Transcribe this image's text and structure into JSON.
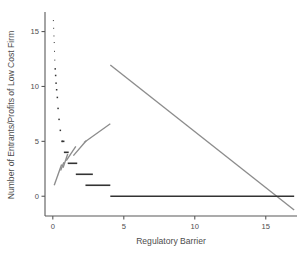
{
  "chart_data": {
    "type": "line",
    "title": "",
    "subtitle": "",
    "xlabel": "Regulatory Barrier",
    "ylabel": "Number of Entrants/Profits of Low Cost Firm",
    "xlim": [
      -0.55,
      17.2
    ],
    "ylim": [
      -1.8,
      16.6
    ],
    "xticks": [
      0,
      5,
      10,
      15
    ],
    "xtick_labels": [
      "0",
      "5",
      "10",
      "15"
    ],
    "yticks": [
      0,
      5,
      10,
      15
    ],
    "ytick_labels": [
      "0",
      "5",
      "10",
      "15"
    ],
    "grid": false,
    "legend": "none",
    "colors": {
      "entrants": "#333333",
      "profits": "#8c8c8c",
      "axis": "#595959",
      "text": "#4d4d4d",
      "background": "#ffffff"
    },
    "series": [
      {
        "name": "Number of Entrants (step function)",
        "type": "step",
        "color": "#333333",
        "style": "points-then-segments",
        "points": [
          {
            "x": 0.04,
            "y": 16.0
          },
          {
            "x": 0.06,
            "y": 15.3
          },
          {
            "x": 0.08,
            "y": 14.6
          },
          {
            "x": 0.1,
            "y": 14.0
          },
          {
            "x": 0.12,
            "y": 13.2
          },
          {
            "x": 0.14,
            "y": 12.4
          },
          {
            "x": 0.17,
            "y": 11.6
          },
          {
            "x": 0.2,
            "y": 11.0
          },
          {
            "x": 0.23,
            "y": 10.3
          },
          {
            "x": 0.27,
            "y": 9.7
          },
          {
            "x": 0.32,
            "y": 9.0
          },
          {
            "x": 0.37,
            "y": 8.0
          },
          {
            "x": 0.44,
            "y": 7.0
          },
          {
            "x": 0.53,
            "y": 6.0
          },
          {
            "x": 0.66,
            "y": 5.0
          },
          {
            "x": 0.86,
            "y": 4.0
          },
          {
            "x": 1.2,
            "y": 3.0
          },
          {
            "x": 1.8,
            "y": 2.0
          },
          {
            "x": 2.9,
            "y": 1.0
          },
          {
            "x": 9.5,
            "y": 0.0
          }
        ],
        "segments": [
          {
            "x1": 0.62,
            "y1": 5.0,
            "x2": 0.82,
            "y2": 5.0
          },
          {
            "x1": 0.78,
            "y1": 4.0,
            "x2": 1.12,
            "y2": 4.0
          },
          {
            "x1": 1.05,
            "y1": 3.0,
            "x2": 1.72,
            "y2": 3.0
          },
          {
            "x1": 1.62,
            "y1": 2.0,
            "x2": 2.82,
            "y2": 2.0
          },
          {
            "x1": 2.3,
            "y1": 1.0,
            "x2": 4.05,
            "y2": 1.0
          },
          {
            "x1": 4.05,
            "y1": 0.0,
            "x2": 17.0,
            "y2": 0.0
          }
        ]
      },
      {
        "name": "Profits of Low Cost Firm (sawtooth)",
        "type": "line-segments",
        "color": "#8c8c8c",
        "segments": [
          {
            "x1": 0.1,
            "y1": 1.0,
            "x2": 0.62,
            "y2": 2.9
          },
          {
            "x1": 0.55,
            "y1": 2.35,
            "x2": 0.78,
            "y2": 3.1
          },
          {
            "x1": 0.72,
            "y1": 2.6,
            "x2": 1.05,
            "y2": 3.85
          },
          {
            "x1": 0.95,
            "y1": 3.25,
            "x2": 1.62,
            "y2": 4.55
          },
          {
            "x1": 1.45,
            "y1": 3.7,
            "x2": 2.35,
            "y2": 5.05
          },
          {
            "x1": 2.2,
            "y1": 4.9,
            "x2": 4.05,
            "y2": 6.6
          },
          {
            "x1": 4.05,
            "y1": 11.95,
            "x2": 17.0,
            "y2": -1.25
          }
        ]
      }
    ],
    "annotations": []
  }
}
